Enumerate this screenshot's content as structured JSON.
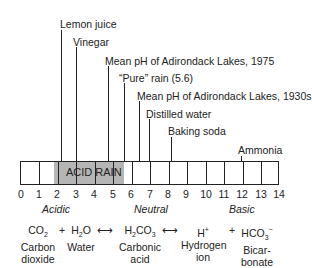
{
  "scale": {
    "min": 0,
    "max": 14,
    "ticks": [
      "0",
      "1",
      "2",
      "3",
      "4",
      "5",
      "6",
      "7",
      "8",
      "9",
      "10",
      "11",
      "12",
      "13",
      "14"
    ],
    "acid_rain_label": "ACID RAIN",
    "acid_rain_range": [
      1.8,
      5.6
    ],
    "regions": {
      "acidic": "Acidic",
      "neutral": "Neutral",
      "basic": "Basic"
    }
  },
  "markers": [
    {
      "label": "Lemon juice",
      "ph": 2.3
    },
    {
      "label": "Vinegar",
      "ph": 3.0
    },
    {
      "label": "Mean pH of Adirondack Lakes, 1975",
      "ph": 4.8
    },
    {
      "label": "“Pure” rain (5.6)",
      "ph": 5.6
    },
    {
      "label": "Mean pH of Adirondack Lakes, 1930s",
      "ph": 6.5
    },
    {
      "label": "Distilled water",
      "ph": 7.0
    },
    {
      "label": "Baking soda",
      "ph": 8.2
    },
    {
      "label": "Ammonia",
      "ph": 12.0
    }
  ],
  "equation": {
    "terms": [
      {
        "formula_main": "CO",
        "formula_sub": "2",
        "name1": "Carbon",
        "name2": "dioxide"
      },
      {
        "formula_main": "H",
        "formula_sub": "2",
        "formula_tail": "O",
        "name1": "Water",
        "name2": ""
      },
      {
        "formula_main": "H",
        "formula_sub": "2",
        "formula_tail": "CO",
        "formula_sub2": "3",
        "name1": "Carbonic",
        "name2": "acid"
      },
      {
        "formula_main": "H",
        "formula_sup": "+",
        "name1": "Hydrogen",
        "name2": "ion"
      },
      {
        "formula_main": "HCO",
        "formula_sub": "3",
        "formula_sup": "−",
        "name1": "Bicar-",
        "name2": "bonate"
      }
    ],
    "operators": [
      "+",
      "⟷",
      "⟷",
      "+"
    ]
  }
}
